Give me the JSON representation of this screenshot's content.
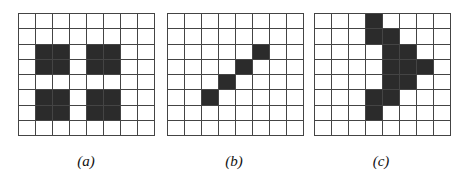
{
  "figure": {
    "panels": [
      {
        "label": "(a)",
        "rows": 8,
        "cols": 8,
        "filled": [
          [
            2,
            1
          ],
          [
            2,
            2
          ],
          [
            3,
            1
          ],
          [
            3,
            2
          ],
          [
            2,
            4
          ],
          [
            2,
            5
          ],
          [
            3,
            4
          ],
          [
            3,
            5
          ],
          [
            5,
            1
          ],
          [
            5,
            2
          ],
          [
            6,
            1
          ],
          [
            6,
            2
          ],
          [
            5,
            4
          ],
          [
            5,
            5
          ],
          [
            6,
            4
          ],
          [
            6,
            5
          ]
        ]
      },
      {
        "label": "(b)",
        "rows": 8,
        "cols": 8,
        "filled": [
          [
            2,
            5
          ],
          [
            3,
            4
          ],
          [
            4,
            3
          ],
          [
            5,
            2
          ]
        ]
      },
      {
        "label": "(c)",
        "rows": 8,
        "cols": 8,
        "filled": [
          [
            0,
            3
          ],
          [
            1,
            3
          ],
          [
            1,
            4
          ],
          [
            2,
            4
          ],
          [
            2,
            5
          ],
          [
            3,
            4
          ],
          [
            3,
            5
          ],
          [
            3,
            6
          ],
          [
            4,
            4
          ],
          [
            4,
            5
          ],
          [
            5,
            3
          ],
          [
            5,
            4
          ],
          [
            6,
            3
          ]
        ]
      }
    ],
    "colors": {
      "filled": "#2b2b2b",
      "empty": "#ffffff",
      "grid_line": "#444444"
    }
  }
}
